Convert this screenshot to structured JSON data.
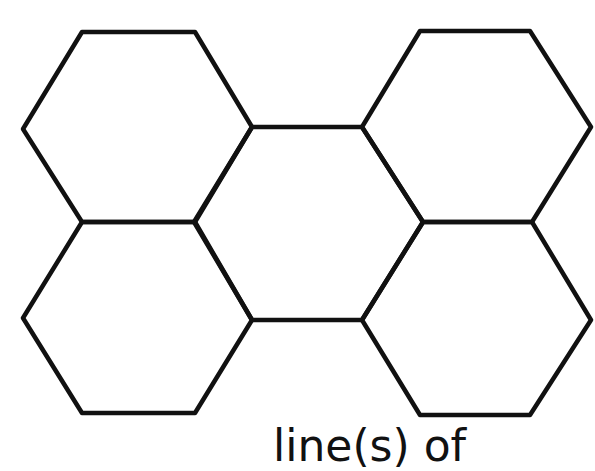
{
  "diagram": {
    "type": "hexagon-tiling",
    "stroke_color": "#111111",
    "background": "#ffffff",
    "hexagons": [
      {
        "name": "hexagon-top-left",
        "points": "82,32 195,32 252,127 195,222 82,222 23,129"
      },
      {
        "name": "hexagon-bottom-left",
        "points": "82,222 195,222 252,320 195,413 82,413 23,318"
      },
      {
        "name": "hexagon-center",
        "points": "252,127 362,127 423,222 362,320 252,320 194,222"
      },
      {
        "name": "hexagon-top-right",
        "points": "420,31 530,31 591,127 532,222 423,222 362,127"
      },
      {
        "name": "hexagon-bottom-right",
        "points": "423,222 532,222 591,320 530,415 420,415 362,320"
      }
    ],
    "caption": "line(s) of"
  }
}
